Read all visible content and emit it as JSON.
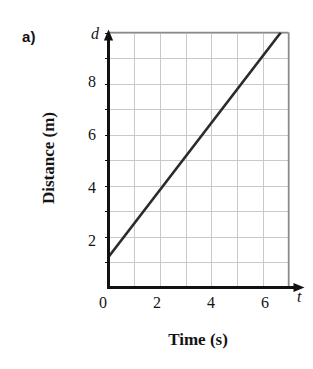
{
  "figure": {
    "part_label": "a)"
  },
  "chart_data": {
    "type": "line",
    "title": "",
    "subtitle": "",
    "xlabel": "Time (s)",
    "ylabel": "Distance (m)",
    "x_axis_variable": "t",
    "y_axis_variable": "d",
    "xlim": [
      0,
      7
    ],
    "ylim": [
      0,
      10
    ],
    "xticks": [
      0,
      2,
      4,
      6
    ],
    "xtick_labels": [
      "0",
      "2",
      "4",
      "6"
    ],
    "yticks": [
      2,
      4,
      6,
      8
    ],
    "ytick_labels": [
      "2",
      "4",
      "6",
      "8"
    ],
    "grid": true,
    "grid_step_x": 1,
    "grid_step_y": 1,
    "legend": "none",
    "series": [
      {
        "name": "distance-vs-time",
        "x": [
          0,
          6.7
        ],
        "y": [
          1.2,
          10
        ],
        "intercept": 1.2,
        "slope": 1.31,
        "color": "#2b2b2b"
      }
    ],
    "colors": {
      "line": "#2b2b2b",
      "axis": "#111111",
      "grid": "#c9c9c9",
      "frame": "#8a8a8a",
      "text": "#141414",
      "background": "#ffffff"
    }
  },
  "axes_labels": {
    "y_tick_8": "8",
    "y_tick_6": "6",
    "y_tick_4": "4",
    "y_tick_2": "2",
    "x_tick_0": "0",
    "x_tick_2": "2",
    "x_tick_4": "4",
    "x_tick_6": "6"
  }
}
